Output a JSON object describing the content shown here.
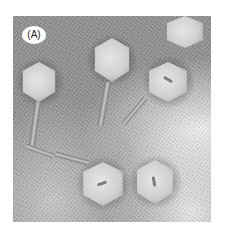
{
  "figure": {
    "panel_label": "(A)",
    "colors": {
      "background": "#ffffff",
      "stain": "#8e8e8e",
      "capsid": "#d9d9d9"
    }
  }
}
